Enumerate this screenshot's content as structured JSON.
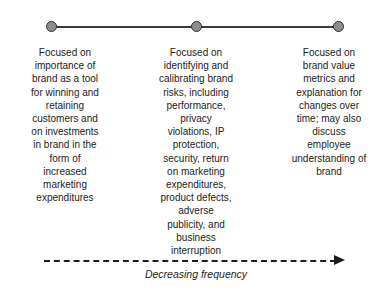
{
  "diagram": {
    "type": "timeline-with-columns",
    "background_color": "#ffffff",
    "line_color": "#3a3a3a",
    "node_fill_color": "#8e8e8e",
    "node_border_color": "#2f2f2f",
    "text_color": "#1c1c1c",
    "nodes": [
      {
        "id": "node-1",
        "x": 51
      },
      {
        "id": "node-2",
        "x": 196
      },
      {
        "id": "node-3",
        "x": 338
      }
    ],
    "columns": [
      {
        "id": "column-1",
        "text": "Focused on\nimportance of\nbrand as a tool\nfor winning and\nretaining\ncustomers and\non investments\nin brand in the\nform of\nincreased\nmarketing\nexpenditures"
      },
      {
        "id": "column-2",
        "text": "Focused on\nidentifying and\ncalibrating brand\nrisks, including\nperformance,\nprivacy\nviolations, IP\nprotection,\nsecurity, return\non marketing\nexpenditures,\nproduct defects,\nadverse\npublicity, and\nbusiness\ninterruption"
      },
      {
        "id": "column-3",
        "text": "Focused on\nbrand value\nmetrics and\nexplanation for\nchanges over\ntime; may also\ndiscuss\nemployee\nunderstanding of\nbrand"
      }
    ],
    "arrow": {
      "caption": "Decreasing frequency",
      "style": "dashed",
      "direction": "right",
      "color": "#1d1d1d"
    }
  }
}
